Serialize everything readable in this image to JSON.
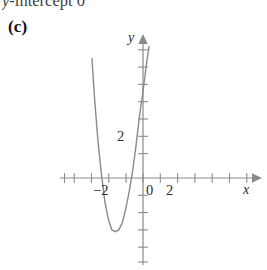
{
  "heading": {
    "prefix_italic": "y",
    "text": "-intercept 0",
    "full": "y-intercept 0"
  },
  "part_label": "(c)",
  "chart_data": {
    "type": "line",
    "title": "",
    "subtitle": "",
    "xlabel": "x",
    "ylabel": "y",
    "grid": false,
    "legend": null,
    "xlim": [
      -4.8,
      6.5
    ],
    "ylim": [
      -4.2,
      7.8
    ],
    "x_ticks": [
      -4,
      -3,
      -2,
      -1,
      0,
      1,
      2,
      3,
      4,
      5,
      6
    ],
    "x_tick_labels": [
      "",
      "",
      "-2",
      "",
      "0",
      "",
      "2",
      "",
      "",
      "",
      ""
    ],
    "y_ticks": [
      -4,
      -3,
      -2,
      -1,
      1,
      2,
      3,
      4,
      5,
      6,
      7
    ],
    "y_tick_labels": [
      "",
      "",
      "",
      "",
      "",
      "2",
      "",
      "",
      "",
      "",
      ""
    ],
    "axis_arrows": [
      "x-positive",
      "y-positive"
    ],
    "series": [
      {
        "name": "parabola",
        "type": "curve",
        "color": "#8a8a8a",
        "equation": "y = a(x + 1.55)^2 - 3.1",
        "vertex": [
          -1.55,
          -3.1
        ],
        "roots": [
          -2.55,
          -0.55
        ],
        "opens": "up",
        "x": [
          -2.95,
          -2.8,
          -2.6,
          -2.4,
          -2.2,
          -2.0,
          -1.8,
          -1.6,
          -1.4,
          -1.2,
          -1.0,
          -0.8,
          -0.6,
          -0.4,
          -0.2,
          0.0,
          0.2,
          0.35
        ],
        "y": [
          6.9,
          4.6,
          2.1,
          0.2,
          -1.4,
          -2.4,
          -3.0,
          -3.1,
          -3.0,
          -2.6,
          -1.8,
          -0.8,
          0.4,
          1.9,
          3.6,
          5.0,
          6.6,
          7.6
        ]
      }
    ]
  }
}
